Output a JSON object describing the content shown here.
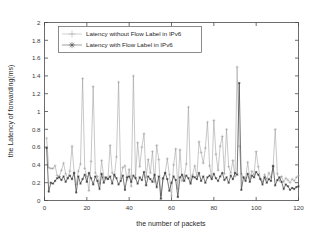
{
  "chart_data": {
    "type": "line",
    "title": "",
    "xlabel": "the number of packets",
    "ylabel": "the Latency of forwarding(ms)",
    "xlim": [
      0,
      120
    ],
    "ylim": [
      0,
      2
    ],
    "xticks": [
      0,
      20,
      40,
      60,
      80,
      100,
      120
    ],
    "xtick_labels": [
      "0",
      "20",
      "40",
      "60",
      "80",
      "100",
      "120"
    ],
    "yticks": [
      0,
      0.2,
      0.4,
      0.6,
      0.8,
      1,
      1.2,
      1.4,
      1.6,
      1.8,
      2
    ],
    "ytick_labels": [
      "0",
      "0.2",
      "0.4",
      "0.6",
      "0.8",
      "1",
      "1.2",
      "1.4",
      "1.6",
      "1.8",
      "2"
    ],
    "grid": false,
    "legend_position": "top-left-inside",
    "marker_light": "plus",
    "marker_dark": "asterisk",
    "color_light": "#9a9a9a",
    "color_dark": "#3c3c3c",
    "x": [
      1,
      2,
      3,
      4,
      5,
      6,
      7,
      8,
      9,
      10,
      11,
      12,
      13,
      14,
      15,
      16,
      17,
      18,
      19,
      20,
      21,
      22,
      23,
      24,
      25,
      26,
      27,
      28,
      29,
      30,
      31,
      32,
      33,
      34,
      35,
      36,
      37,
      38,
      39,
      40,
      41,
      42,
      43,
      44,
      45,
      46,
      47,
      48,
      49,
      50,
      51,
      52,
      53,
      54,
      55,
      56,
      57,
      58,
      59,
      60,
      61,
      62,
      63,
      64,
      65,
      66,
      67,
      68,
      69,
      70,
      71,
      72,
      73,
      74,
      75,
      76,
      77,
      78,
      79,
      80,
      81,
      82,
      83,
      84,
      85,
      86,
      87,
      88,
      89,
      90,
      91,
      92,
      93,
      94,
      95,
      96,
      97,
      98,
      99,
      100,
      101,
      102,
      103,
      104,
      105,
      106,
      107,
      108,
      109,
      110,
      111,
      112,
      113,
      114,
      115,
      116,
      117,
      118,
      119,
      120
    ],
    "series": [
      {
        "name": "Latency without Flow Label in IPv6",
        "color": "#9a9a9a",
        "marker": "plus",
        "values": [
          0.7,
          0.37,
          0.36,
          0.36,
          0.39,
          0.28,
          0.27,
          0.34,
          0.42,
          0.3,
          0.25,
          0.33,
          0.61,
          0.31,
          0.18,
          0.33,
          0.41,
          1.37,
          0.36,
          0.27,
          0.11,
          0.44,
          1.28,
          0.31,
          0.27,
          0.19,
          0.45,
          0.26,
          0.24,
          0.25,
          0.62,
          0.31,
          0.27,
          0.49,
          1.33,
          0.25,
          0.37,
          0.39,
          0.23,
          0.35,
          0.16,
          1.4,
          0.26,
          0.65,
          0.38,
          0.6,
          0.75,
          0.26,
          0.46,
          0.31,
          0.55,
          0.21,
          0.62,
          0.46,
          0.06,
          0.24,
          0.31,
          0.47,
          0.29,
          0.05,
          0.4,
          0.58,
          0.13,
          0.57,
          0.22,
          0.27,
          0.41,
          1.05,
          0.2,
          0.29,
          0.39,
          0.27,
          0.66,
          0.54,
          0.42,
          0.59,
          0.88,
          0.39,
          0.26,
          0.9,
          0.52,
          0.34,
          0.61,
          0.72,
          0.3,
          0.8,
          0.38,
          0.31,
          0.45,
          0.27,
          1.5,
          0.61,
          0.3,
          0.26,
          0.25,
          0.43,
          0.25,
          0.33,
          0.29,
          0.55,
          0.38,
          0.24,
          0.21,
          0.29,
          0.24,
          0.31,
          0.26,
          0.38,
          0.8,
          0.3,
          0.22,
          0.27,
          0.21,
          0.25,
          0.23,
          0.2,
          0.24,
          0.22,
          0.26,
          0.28
        ]
      },
      {
        "name": "Latency with Flow Label in IPv6",
        "color": "#3c3c3c",
        "marker": "asterisk",
        "values": [
          0.59,
          0.1,
          0.2,
          0.19,
          0.22,
          0.25,
          0.26,
          0.23,
          0.27,
          0.21,
          0.25,
          0.28,
          0.24,
          0.31,
          0.09,
          0.27,
          0.19,
          0.24,
          0.29,
          0.21,
          0.31,
          0.25,
          0.18,
          0.27,
          0.22,
          0.13,
          0.3,
          0.2,
          0.26,
          0.24,
          0.27,
          0.19,
          0.29,
          0.25,
          0.18,
          0.22,
          0.28,
          0.12,
          0.26,
          0.27,
          0.21,
          0.28,
          0.25,
          0.19,
          0.26,
          0.23,
          0.32,
          0.17,
          0.27,
          0.24,
          0.21,
          0.29,
          0.15,
          0.27,
          0.02,
          0.25,
          0.31,
          0.24,
          0.11,
          0.2,
          0.27,
          0.23,
          0.04,
          0.26,
          0.29,
          0.22,
          0.28,
          0.25,
          0.19,
          0.27,
          0.26,
          0.24,
          0.31,
          0.22,
          0.27,
          0.2,
          0.26,
          0.28,
          0.24,
          0.3,
          0.25,
          0.22,
          0.27,
          0.31,
          0.23,
          0.26,
          0.2,
          0.28,
          0.24,
          0.31,
          0.29,
          1.32,
          0.12,
          0.26,
          0.22,
          0.3,
          0.21,
          0.28,
          0.26,
          0.32,
          0.29,
          0.24,
          0.18,
          0.26,
          0.2,
          0.24,
          0.22,
          0.39,
          0.17,
          0.23,
          0.26,
          0.21,
          0.13,
          0.18,
          0.16,
          0.12,
          0.14,
          0.13,
          0.15,
          0.16
        ]
      }
    ]
  },
  "legend": {
    "items": [
      {
        "label": "Latency without Flow Label in IPv6"
      },
      {
        "label": "Latency with Flow Label in IPv6"
      }
    ]
  }
}
